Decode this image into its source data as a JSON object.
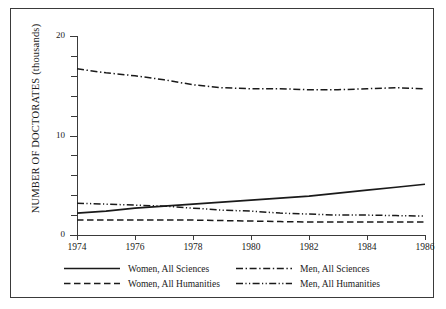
{
  "figure": {
    "clipped_header_text": "",
    "border_color": "#3a3a3a",
    "background": "#ffffff"
  },
  "chart_data": {
    "type": "line",
    "title": "",
    "xlabel": "",
    "ylabel": "NUMBER OF DOCTORATES (thousands)",
    "xlim": [
      1974,
      1986
    ],
    "ylim": [
      0,
      20
    ],
    "grid": false,
    "legend_position": "below-axis",
    "x": [
      1974,
      1975,
      1976,
      1977,
      1978,
      1979,
      1980,
      1981,
      1982,
      1983,
      1984,
      1985,
      1986
    ],
    "xticks": [
      1974,
      1976,
      1978,
      1980,
      1982,
      1984,
      1986
    ],
    "xtick_labels": [
      "1974",
      "1976",
      "1978",
      "1980",
      "1982",
      "1984",
      "1986"
    ],
    "yticks": [
      0,
      2,
      4,
      6,
      8,
      10,
      12,
      14,
      16,
      18,
      20
    ],
    "ytick_labels_major": [
      "0",
      "10",
      "20"
    ],
    "ytick_major_values": [
      0,
      10,
      20
    ],
    "series": [
      {
        "name": "Women, All Sciences",
        "style": "solid",
        "color": "#1a1a1a",
        "values": [
          2.2,
          2.4,
          2.7,
          2.9,
          3.1,
          3.3,
          3.5,
          3.7,
          3.9,
          4.2,
          4.5,
          4.8,
          5.1
        ]
      },
      {
        "name": "Men, All Sciences",
        "style": "dash-dot",
        "color": "#1a1a1a",
        "values": [
          16.7,
          16.3,
          16.0,
          15.6,
          15.1,
          14.8,
          14.7,
          14.7,
          14.6,
          14.6,
          14.7,
          14.8,
          14.7
        ]
      },
      {
        "name": "Women, All Humanities",
        "style": "dashed",
        "color": "#1a1a1a",
        "values": [
          1.5,
          1.5,
          1.5,
          1.5,
          1.5,
          1.45,
          1.4,
          1.35,
          1.3,
          1.3,
          1.3,
          1.3,
          1.3
        ]
      },
      {
        "name": "Men, All Humanities",
        "style": "dash-dot-dot",
        "color": "#1a1a1a",
        "values": [
          3.2,
          3.1,
          3.0,
          2.9,
          2.7,
          2.5,
          2.4,
          2.2,
          2.1,
          2.0,
          2.0,
          1.95,
          1.9
        ]
      }
    ],
    "legend": [
      {
        "label": "Women, All Sciences",
        "style": "solid"
      },
      {
        "label": "Men, All Sciences",
        "style": "dash-dot"
      },
      {
        "label": "Women, All Humanities",
        "style": "dashed"
      },
      {
        "label": "Men, All Humanities",
        "style": "dash-dot-dot"
      }
    ]
  }
}
